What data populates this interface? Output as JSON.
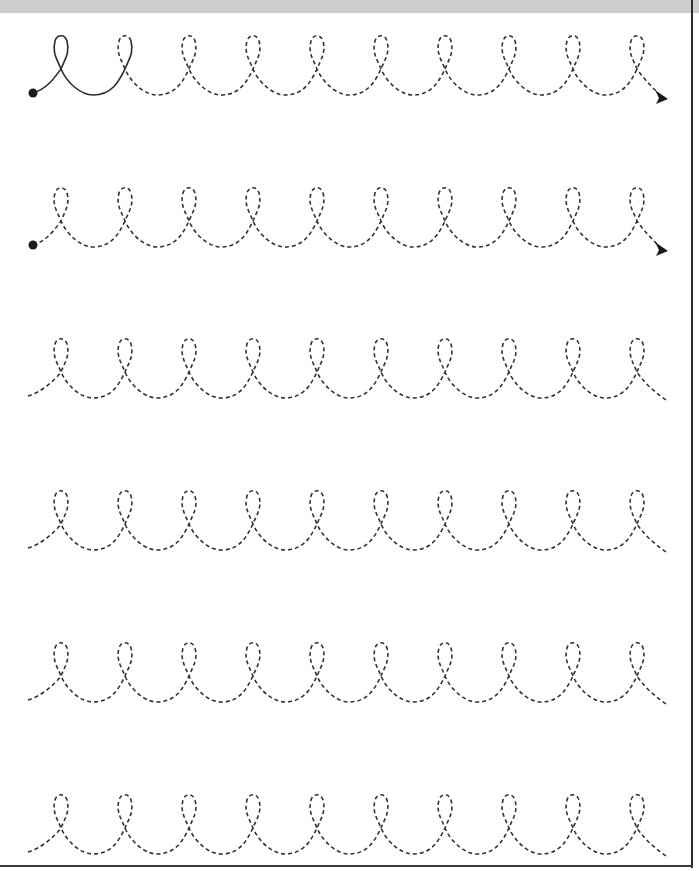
{
  "worksheet": {
    "title": "Loop tracing worksheet",
    "stroke_color": "#333333",
    "solid_color": "#2b2b2b",
    "dot_color": "#1a1a1a",
    "loops_per_row": 10,
    "loop_spacing": 64,
    "first_crossing_x": 61,
    "rows": [
      {
        "baseline_y": 95,
        "has_start_dot": true,
        "has_arrow": true,
        "solid_loops": 1,
        "start_x": 33,
        "end_x": 668
      },
      {
        "baseline_y": 247,
        "has_start_dot": true,
        "has_arrow": true,
        "solid_loops": 0,
        "start_x": 33,
        "end_x": 668
      },
      {
        "baseline_y": 398,
        "has_start_dot": false,
        "has_arrow": false,
        "solid_loops": 0,
        "start_x": 28,
        "end_x": 666
      },
      {
        "baseline_y": 550,
        "has_start_dot": false,
        "has_arrow": false,
        "solid_loops": 0,
        "start_x": 28,
        "end_x": 666
      },
      {
        "baseline_y": 702,
        "has_start_dot": false,
        "has_arrow": false,
        "solid_loops": 0,
        "start_x": 28,
        "end_x": 666
      },
      {
        "baseline_y": 854,
        "has_start_dot": false,
        "has_arrow": false,
        "solid_loops": 0,
        "start_x": 28,
        "end_x": 666
      }
    ]
  },
  "frame": {
    "top_bar_color": "#cdcdcd",
    "border_color": "#2a2a2a"
  }
}
